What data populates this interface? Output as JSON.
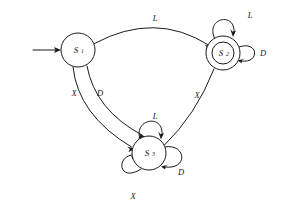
{
  "diagram": {
    "type": "state-machine",
    "background_color": "#ffffff",
    "stroke_color": "#1a1a1a",
    "states": [
      {
        "id": "S1",
        "label": "S",
        "subscript": "1",
        "shape": "circle",
        "accepting": false,
        "is_start": true,
        "cx": 78,
        "cy": 50,
        "r": 17
      },
      {
        "id": "S2",
        "label": "S",
        "subscript": "2",
        "shape": "double-circle",
        "accepting": true,
        "is_start": false,
        "cx": 223,
        "cy": 53,
        "r": 17,
        "r_inner": 11
      },
      {
        "id": "S3",
        "label": "S",
        "subscript": "3",
        "shape": "circle",
        "accepting": false,
        "is_start": false,
        "cx": 149,
        "cy": 153,
        "r": 17
      }
    ],
    "start_arrow": {
      "name": "start-arrow",
      "from_x": 33,
      "to_x": 61,
      "y": 50,
      "target": "S1"
    },
    "transitions": [
      {
        "from": "S1",
        "to": "S2",
        "label": "L",
        "label_x": 155,
        "label_y": 18,
        "kind": "arc-top"
      },
      {
        "from": "S1",
        "to": "S3",
        "label": "X",
        "label_x": 74,
        "label_y": 93,
        "kind": "curve-left"
      },
      {
        "from": "S1",
        "to": "S3",
        "label": "D",
        "label_x": 100,
        "label_y": 93,
        "kind": "curve-right"
      },
      {
        "from": "S2",
        "to": "S3",
        "label": "X",
        "label_x": 197,
        "label_y": 95,
        "kind": "curve"
      }
    ],
    "self_loops": [
      {
        "state": "S2",
        "label": "L",
        "label_x": 250,
        "label_y": 15,
        "position": "top"
      },
      {
        "state": "S2",
        "label": "D",
        "label_x": 263,
        "label_y": 53,
        "position": "right"
      },
      {
        "state": "S3",
        "label": "L",
        "label_x": 155,
        "label_y": 116,
        "position": "top"
      },
      {
        "state": "S3",
        "label": "D",
        "label_x": 181,
        "label_y": 172,
        "position": "right"
      },
      {
        "state": "S3",
        "label": "X",
        "label_x": 133,
        "label_y": 196,
        "position": "bottom-left"
      }
    ],
    "alphabet": [
      "L",
      "D",
      "X"
    ]
  }
}
